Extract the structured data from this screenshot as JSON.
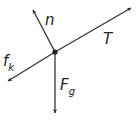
{
  "diagram": {
    "type": "free-body diagram",
    "colors": {
      "stroke": "#333333",
      "text": "#222222",
      "background": "#ffffff"
    },
    "origin": {
      "x": 55,
      "y": 52
    },
    "forces": [
      {
        "id": "n",
        "label": "n",
        "subscript": "",
        "tip": {
          "x": 33,
          "y": 10
        },
        "label_pos": {
          "x": 45,
          "y": 25
        }
      },
      {
        "id": "T",
        "label": "T",
        "subscript": "",
        "tip": {
          "x": 131,
          "y": 8
        },
        "label_pos": {
          "x": 103,
          "y": 44
        }
      },
      {
        "id": "fk",
        "label": "f",
        "subscript": "k",
        "tip": {
          "x": 8,
          "y": 81
        },
        "label_pos": {
          "x": 3,
          "y": 66
        }
      },
      {
        "id": "Fg",
        "label": "F",
        "subscript": "g",
        "tip": {
          "x": 55,
          "y": 113
        },
        "label_pos": {
          "x": 60,
          "y": 90
        }
      }
    ]
  }
}
